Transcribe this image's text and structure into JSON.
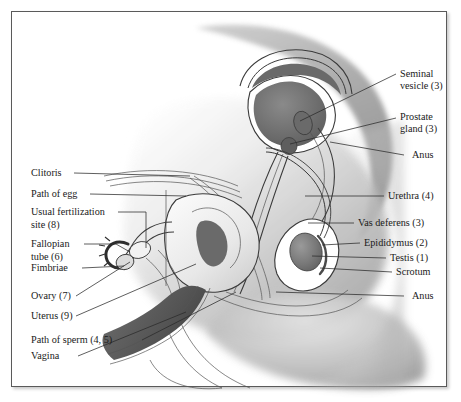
{
  "figure": {
    "border_color": "#5a5a5a",
    "background_color": "#ffffff",
    "ink_color": "#1a1a1a",
    "shade_light": "#d8d8d8",
    "shade_mid": "#a8a8a8",
    "shade_dark": "#6e6e6e",
    "shade_darkest": "#4a4a4a"
  },
  "labels_right": [
    {
      "id": "seminal-vesicle",
      "line1": "Seminal",
      "line2": "vesicle (3)"
    },
    {
      "id": "prostate-gland",
      "line1": "Prostate",
      "line2": "gland (3)"
    },
    {
      "id": "anus-upper",
      "line1": "Anus",
      "line2": ""
    },
    {
      "id": "urethra",
      "line1": "Urethra (4)",
      "line2": ""
    },
    {
      "id": "vas-deferens",
      "line1": "Vas deferens (3)",
      "line2": ""
    },
    {
      "id": "epididymus",
      "line1": "Epididymus (2)",
      "line2": ""
    },
    {
      "id": "testis",
      "line1": "Testis (1)",
      "line2": ""
    },
    {
      "id": "scrotum",
      "line1": "Scrotum",
      "line2": ""
    },
    {
      "id": "anus-lower",
      "line1": "Anus",
      "line2": ""
    }
  ],
  "labels_left": [
    {
      "id": "clitoris",
      "line1": "Clitoris",
      "line2": ""
    },
    {
      "id": "path-of-egg",
      "line1": "Path of egg",
      "line2": ""
    },
    {
      "id": "usual-fertilization-site",
      "line1": "Usual fertilization",
      "line2": "site (8)"
    },
    {
      "id": "fallopian-tube",
      "line1": "Fallopian",
      "line2": "tube (6)"
    },
    {
      "id": "fimbriae",
      "line1": "Fimbriae",
      "line2": ""
    },
    {
      "id": "ovary",
      "line1": "Ovary (7)",
      "line2": ""
    },
    {
      "id": "uterus",
      "line1": "Uterus (9)",
      "line2": ""
    },
    {
      "id": "path-of-sperm",
      "line1": "Path of sperm (4, 5)",
      "line2": ""
    },
    {
      "id": "vagina",
      "line1": "Vagina",
      "line2": ""
    }
  ]
}
